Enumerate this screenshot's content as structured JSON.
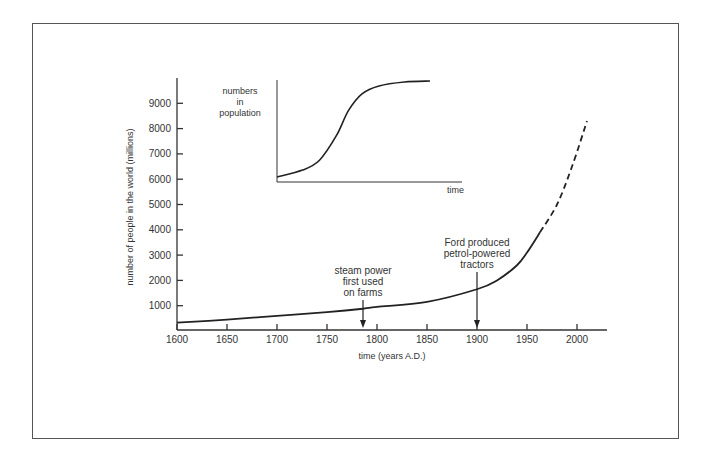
{
  "chart_data": [
    {
      "type": "line",
      "title": "",
      "xlabel": "time (years A.D.)",
      "ylabel": "number of people in the world (millions)",
      "xlim": [
        1600,
        2030
      ],
      "ylim": [
        0,
        9900
      ],
      "x_ticks": [
        1600,
        1650,
        1700,
        1750,
        1800,
        1850,
        1900,
        1950,
        2000
      ],
      "y_ticks": [
        1000,
        2000,
        3000,
        4000,
        5000,
        6000,
        7000,
        8000,
        9000
      ],
      "grid": false,
      "series": [
        {
          "name": "world population (actual)",
          "style": "solid",
          "x": [
            1600,
            1650,
            1700,
            1750,
            1786,
            1800,
            1850,
            1900,
            1920,
            1940,
            1950,
            1963
          ],
          "values": [
            330,
            450,
            600,
            750,
            880,
            950,
            1150,
            1650,
            2000,
            2600,
            3100,
            3900
          ]
        },
        {
          "name": "world population (projected)",
          "style": "dashed",
          "x": [
            1963,
            1980,
            1995,
            2010
          ],
          "values": [
            3900,
            5000,
            6500,
            8300
          ]
        }
      ],
      "annotations": [
        {
          "text_lines": [
            "steam power",
            "first used",
            "on farms"
          ],
          "x": 1786,
          "y": 880,
          "arrow": "down"
        },
        {
          "text_lines": [
            "Ford produced",
            "petrol-powered",
            "tractors"
          ],
          "x": 1900,
          "y": 1650,
          "arrow": "down"
        }
      ]
    },
    {
      "type": "line",
      "title": "inset: logistic (S-shaped) population growth",
      "xlabel": "time",
      "ylabel_lines": [
        "numbers",
        "in",
        "population"
      ],
      "axes_ticks": false,
      "series": [
        {
          "name": "numbers in population",
          "style": "solid",
          "x": [
            0,
            0.15,
            0.25,
            0.35,
            0.42,
            0.5,
            0.6,
            0.75,
            0.9
          ],
          "values": [
            0.03,
            0.1,
            0.2,
            0.45,
            0.7,
            0.87,
            0.95,
            0.99,
            1.0
          ]
        }
      ]
    }
  ]
}
